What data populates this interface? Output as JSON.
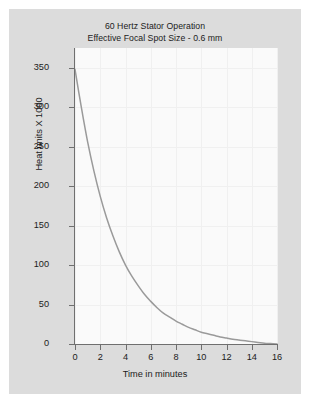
{
  "figure": {
    "background_color": "#ffffff",
    "panel_color": "#dcdcdc",
    "plot_background_color": "#fafafa",
    "axis_color": "#6f6f6f",
    "curve_color": "#9a9a9a",
    "grid_color": "#f0f0f0",
    "text_color": "#1b1b1b"
  },
  "chart_data": {
    "type": "line",
    "title": "60 Hertz Stator Operation",
    "subtitle": "Effective Focal Spot Size - 0.6 mm",
    "xlabel": "Time in minutes",
    "ylabel": "Heat units X 1000",
    "xlim": [
      0,
      16
    ],
    "ylim": [
      0,
      375
    ],
    "xticks": [
      0,
      2,
      4,
      6,
      8,
      10,
      12,
      14,
      16
    ],
    "xtick_labels": [
      "0",
      "2",
      "4",
      "6",
      "8",
      "10",
      "12",
      "14",
      "16"
    ],
    "yticks": [
      0,
      50,
      100,
      150,
      200,
      250,
      300,
      350
    ],
    "ytick_labels": [
      "0",
      "50",
      "100",
      "150",
      "200",
      "250",
      "300",
      "350"
    ],
    "grid": true,
    "legend": null,
    "series": [
      {
        "name": "Anode cooling curve",
        "x": [
          0,
          0.5,
          1,
          1.5,
          2,
          2.5,
          3,
          3.5,
          4,
          4.5,
          5,
          5.5,
          6,
          6.5,
          7,
          7.5,
          8,
          8.5,
          9,
          9.5,
          10,
          10.5,
          11,
          11.5,
          12,
          12.5,
          13,
          13.5,
          14,
          14.5,
          15,
          15.5,
          16
        ],
        "y": [
          348,
          300,
          256,
          219,
          187,
          160,
          137,
          117,
          100,
          86,
          74,
          63,
          54,
          46,
          39,
          34,
          29,
          25,
          21,
          18,
          15,
          13,
          11,
          9,
          7.5,
          6,
          5,
          4,
          3,
          2,
          1,
          0.5,
          0
        ]
      }
    ],
    "annotations": []
  },
  "axes": {
    "x_tick_values": [
      "0",
      "2",
      "4",
      "6",
      "8",
      "10",
      "12",
      "14",
      "16"
    ],
    "y_tick_values": [
      "350",
      "300",
      "250",
      "200",
      "150",
      "100",
      "50",
      "0"
    ]
  }
}
